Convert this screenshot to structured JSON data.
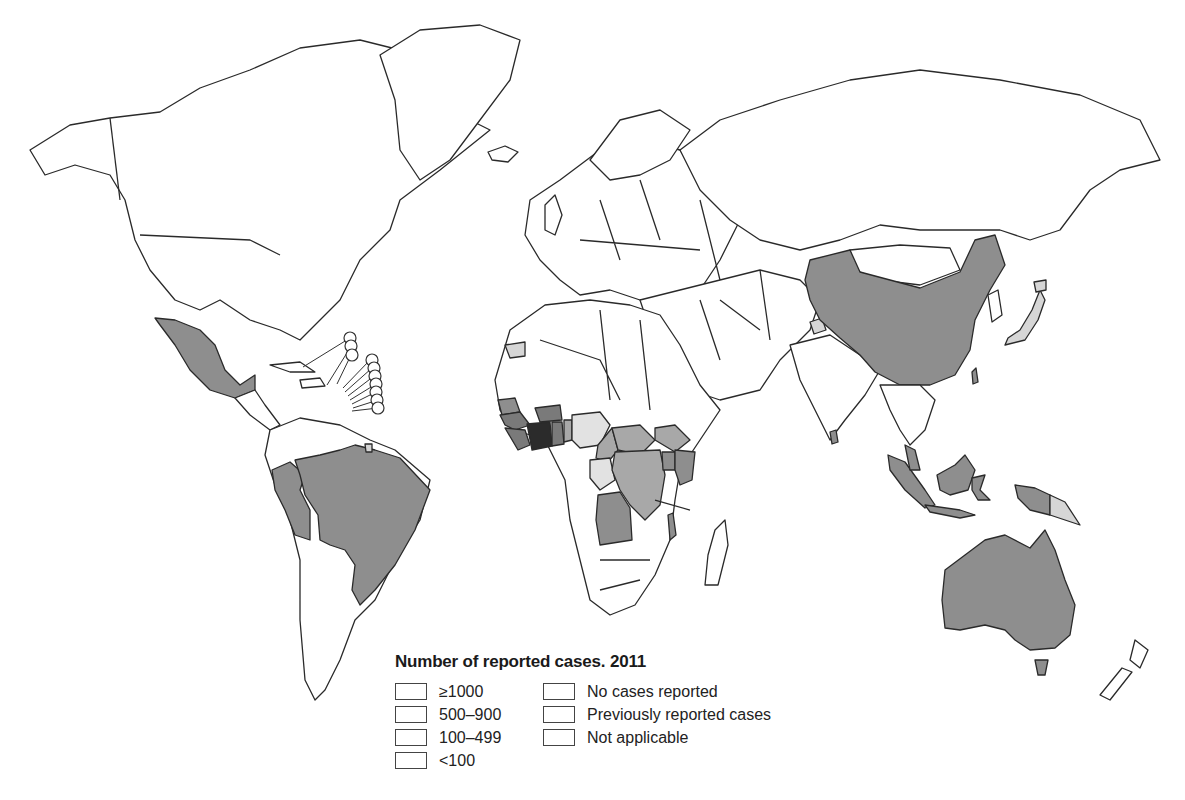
{
  "map": {
    "title": "Number of reported cases. 2011",
    "categories": [
      {
        "id": "ge1000",
        "label": "≥1000",
        "color": "#2b2b2b"
      },
      {
        "id": "500_900",
        "label": "500–900",
        "color": "#7a7a7a"
      },
      {
        "id": "100_499",
        "label": "100–499",
        "color": "#a8a8a8"
      },
      {
        "id": "lt100",
        "label": "<100",
        "color": "#e2e2e2"
      },
      {
        "id": "none",
        "label": "No cases reported",
        "color": "#ffffff"
      },
      {
        "id": "previous",
        "label": "Previously reported cases",
        "color": "#8e8e8e"
      },
      {
        "id": "na",
        "label": "Not applicable",
        "color": "#d6d6d6"
      }
    ],
    "regions": {
      "ge1000": [
        "Côte d'Ivoire"
      ],
      "500_900": [
        "Guinea",
        "Sierra Leone",
        "Liberia",
        "Ghana",
        "Burkina Faso"
      ],
      "100_499": [
        "Democratic Republic of the Congo",
        "Cameroon",
        "Central African Republic",
        "Chad",
        "Sudan",
        "Togo",
        "Benin"
      ],
      "lt100": [
        "Nigeria",
        "Gabon",
        "Republic of the Congo",
        "Equatorial Guinea"
      ],
      "previous": [
        "Mexico",
        "Brazil",
        "Peru",
        "China",
        "Australia",
        "Indonesia",
        "Malaysia",
        "Papua New Guinea (west)",
        "Angola",
        "Senegal",
        "Uganda",
        "Kenya",
        "Malawi",
        "Taiwan",
        "Sri Lanka"
      ],
      "na": [
        "Western Sahara",
        "Kashmir",
        "Japan",
        "Papua New Guinea (east)",
        "French Guiana"
      ]
    }
  },
  "legend": {
    "title": "Number of reported cases. 2011",
    "left": [
      {
        "label": "≥1000",
        "swatch": "c-ge1000"
      },
      {
        "label": "500–900",
        "swatch": "c-500"
      },
      {
        "label": "100–499",
        "swatch": "c-100"
      },
      {
        "label": "<100",
        "swatch": "c-lt100"
      }
    ],
    "right": [
      {
        "label": "No cases reported",
        "swatch": "c-none"
      },
      {
        "label": "Previously reported cases",
        "swatch": "c-prev"
      },
      {
        "label": "Not applicable",
        "swatch": "c-na"
      }
    ]
  }
}
